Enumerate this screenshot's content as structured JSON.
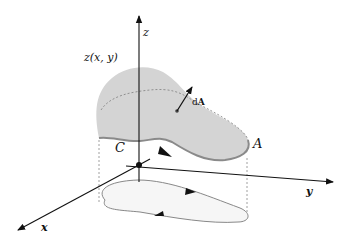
{
  "figure": {
    "title": "",
    "labels": {
      "surface_function": "z(x, y)",
      "z_axis": "z",
      "x_axis": "x",
      "y_axis": "y",
      "boundary_curve": "C",
      "surface": "A",
      "area_element_prefix": "d",
      "area_element_vector": "A"
    },
    "colors": {
      "surface_fill": "#d4d4d4",
      "surface_edge": "#8a8a8a",
      "projection_fill": "#f6f6f6",
      "projection_edge": "#888888",
      "axis": "#111111",
      "dashed": "#888888"
    }
  }
}
